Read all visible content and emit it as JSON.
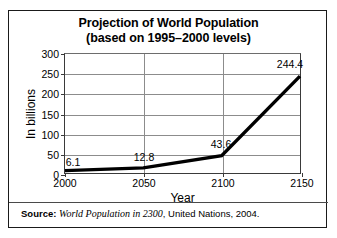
{
  "chart_data": {
    "type": "line",
    "title": "Projection of World Population",
    "subtitle": "(based on 1995–2000 levels)",
    "xlabel": "Year",
    "ylabel": "In billions",
    "x": [
      2000,
      2050,
      2100,
      2150
    ],
    "values": [
      6.1,
      12.8,
      43.6,
      244.4
    ],
    "point_labels": [
      "6.1",
      "12.8",
      "43.6",
      "244.4"
    ],
    "categories": [
      "2000",
      "2050",
      "2100",
      "2150"
    ],
    "xlim": [
      2000,
      2150
    ],
    "ylim": [
      0,
      300
    ],
    "xticks": [
      2000,
      2050,
      2100,
      2150
    ],
    "xtick_labels": [
      "2000",
      "2050",
      "2100",
      "2150"
    ],
    "yticks": [
      0,
      50,
      100,
      150,
      200,
      250,
      300
    ],
    "ytick_labels": [
      "0",
      "50",
      "100",
      "150",
      "200",
      "250",
      "300"
    ],
    "grid": "horizontal-and-vertical",
    "legend": "none",
    "series_color": "#000000",
    "grid_color": "#8c8c8c",
    "axis_color": "#3a3a3a"
  },
  "source": {
    "prefix": "Source:",
    "title": "World Population in 2300",
    "rest": ", United Nations, 2004."
  }
}
